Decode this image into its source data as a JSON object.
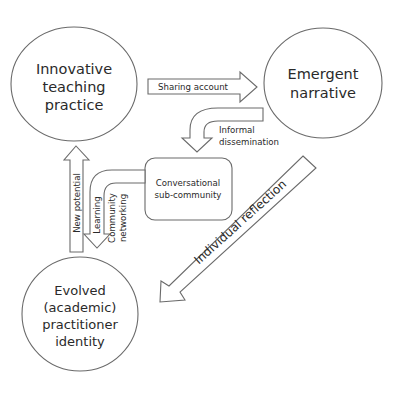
{
  "diagram": {
    "colors": {
      "stroke": "#6a6a6a",
      "fill": "#ffffff",
      "text": "#2a2a2a",
      "background": "#ffffff"
    },
    "nodes": {
      "innovative": {
        "lines": [
          "Innovative",
          "teaching",
          "practice"
        ]
      },
      "emergent": {
        "lines": [
          "Emergent",
          "narrative"
        ]
      },
      "evolved": {
        "lines": [
          "Evolved",
          "(academic)",
          "practitioner",
          "identity"
        ]
      },
      "conversational": {
        "lines": [
          "Conversational",
          "sub-community"
        ]
      }
    },
    "edges": {
      "sharing": {
        "label": "Sharing account",
        "from": "Innovative teaching practice",
        "to": "Emergent narrative"
      },
      "informal": {
        "lines": [
          "Informal",
          "dissemination"
        ],
        "from": "Emergent narrative",
        "to": "Conversational sub-community"
      },
      "reflection": {
        "label": "Individual reflection",
        "from": "Emergent narrative",
        "to": "Evolved (academic) practitioner identity"
      },
      "new_potential": {
        "label": "New potential",
        "from": "Evolved (academic) practitioner identity",
        "to": "Innovative teaching practice"
      },
      "learning": {
        "label": "Learning",
        "from": "Conversational sub-community",
        "to": "Evolved (academic) practitioner identity"
      },
      "community": {
        "lines": [
          "Community",
          "networking"
        ]
      }
    }
  }
}
